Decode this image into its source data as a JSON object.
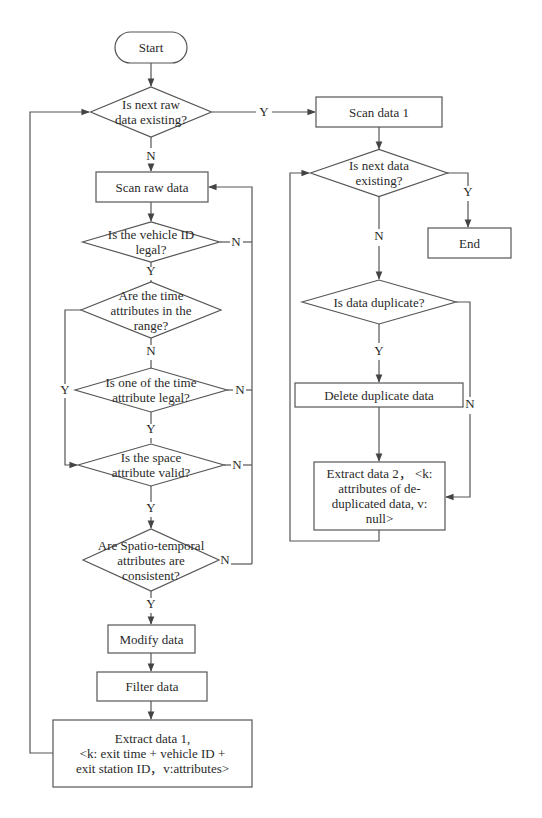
{
  "flowchart": {
    "stroke_color": "#555555",
    "text_color": "#2a2a2a",
    "nodes": [
      {
        "id": "start",
        "type": "terminal",
        "lines": [
          "Start"
        ],
        "x": 115,
        "y": 32,
        "w": 72,
        "h": 31
      },
      {
        "id": "d-next-raw",
        "type": "decision",
        "lines": [
          "Is next raw",
          "data existing?"
        ],
        "cx": 151,
        "cy": 112,
        "w": 121,
        "h": 50
      },
      {
        "id": "scan-raw",
        "type": "process",
        "lines": [
          "Scan raw data"
        ],
        "x": 96,
        "y": 172,
        "w": 112,
        "h": 30
      },
      {
        "id": "d-vehicle-id",
        "type": "decision",
        "lines": [
          "Is the vehicle ID",
          "legal?"
        ],
        "cx": 151,
        "cy": 242,
        "w": 137,
        "h": 40
      },
      {
        "id": "d-time-range",
        "type": "decision",
        "lines": [
          "Are the time",
          "attributes in the",
          "range?"
        ],
        "cx": 151,
        "cy": 310,
        "w": 140,
        "h": 56
      },
      {
        "id": "d-one-time-legal",
        "type": "decision",
        "lines": [
          "Is one of the time",
          "attribute legal?"
        ],
        "cx": 151,
        "cy": 390,
        "w": 152,
        "h": 44
      },
      {
        "id": "d-space-valid",
        "type": "decision",
        "lines": [
          "Is the space",
          "attribute valid?"
        ],
        "cx": 151,
        "cy": 465,
        "w": 146,
        "h": 42
      },
      {
        "id": "d-spatio-temporal",
        "type": "decision",
        "lines": [
          "Are Spatio-temporal",
          "attributes are",
          "consistent?"
        ],
        "cx": 151,
        "cy": 560,
        "w": 136,
        "h": 62
      },
      {
        "id": "modify",
        "type": "process",
        "lines": [
          "Modify data"
        ],
        "x": 108,
        "y": 625,
        "w": 87,
        "h": 28
      },
      {
        "id": "filter",
        "type": "process",
        "lines": [
          "Filter data"
        ],
        "x": 97,
        "y": 672,
        "w": 110,
        "h": 29
      },
      {
        "id": "extract-1",
        "type": "process",
        "lines": [
          "Extract data 1,",
          "<k: exit time + vehicle ID +",
          "exit station ID，v:attributes>"
        ],
        "x": 53,
        "y": 720,
        "w": 199,
        "h": 67
      },
      {
        "id": "scan-data-1",
        "type": "process",
        "lines": [
          "Scan data 1"
        ],
        "x": 316,
        "y": 97,
        "w": 126,
        "h": 30
      },
      {
        "id": "d-next-data",
        "type": "decision",
        "lines": [
          "Is next data",
          "existing?"
        ],
        "cx": 379,
        "cy": 173,
        "w": 137,
        "h": 47
      },
      {
        "id": "end",
        "type": "process",
        "lines": [
          "End"
        ],
        "x": 428,
        "y": 228,
        "w": 83,
        "h": 30
      },
      {
        "id": "d-duplicate",
        "type": "decision",
        "lines": [
          "Is data duplicate?"
        ],
        "cx": 379,
        "cy": 302,
        "w": 154,
        "h": 44
      },
      {
        "id": "delete-dup",
        "type": "process",
        "lines": [
          "Delete duplicate data"
        ],
        "x": 295,
        "y": 383,
        "w": 168,
        "h": 24
      },
      {
        "id": "extract-2",
        "type": "process",
        "lines": [
          "Extract data 2， <k:",
          "attributes of de-",
          "duplicated data, v:",
          "null>"
        ],
        "x": 314,
        "y": 462,
        "w": 131,
        "h": 68
      }
    ],
    "edge_labels": [
      {
        "text": "Y",
        "x": 264,
        "y": 116
      },
      {
        "text": "N",
        "x": 151,
        "y": 160
      },
      {
        "text": "N",
        "x": 236,
        "y": 246
      },
      {
        "text": "Y",
        "x": 151,
        "y": 275
      },
      {
        "text": "N",
        "x": 151,
        "y": 355
      },
      {
        "text": "Y",
        "x": 65,
        "y": 394
      },
      {
        "text": "N",
        "x": 240,
        "y": 394
      },
      {
        "text": "Y",
        "x": 151,
        "y": 433
      },
      {
        "text": "N",
        "x": 237,
        "y": 469
      },
      {
        "text": "Y",
        "x": 151,
        "y": 512
      },
      {
        "text": "N",
        "x": 225,
        "y": 564
      },
      {
        "text": "Y",
        "x": 151,
        "y": 608
      },
      {
        "text": "Y",
        "x": 468,
        "y": 196
      },
      {
        "text": "N",
        "x": 379,
        "y": 240
      },
      {
        "text": "Y",
        "x": 379,
        "y": 355
      },
      {
        "text": "N",
        "x": 470,
        "y": 408
      }
    ],
    "caption": ""
  }
}
